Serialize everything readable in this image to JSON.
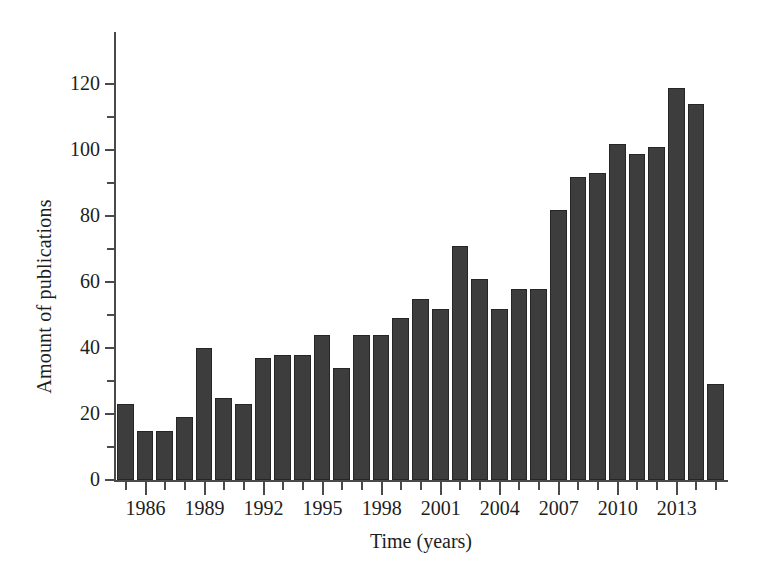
{
  "chart_data": {
    "type": "bar",
    "title": "",
    "subtitle": "",
    "xlabel": "Time (years)",
    "ylabel": "Amount of publications",
    "grid": false,
    "legend": null,
    "ylim": [
      0,
      128
    ],
    "ytick_labels": [
      "0",
      "20",
      "40",
      "60",
      "80",
      "100",
      "120"
    ],
    "ytick_values": [
      0,
      20,
      40,
      60,
      80,
      100,
      120
    ],
    "yminor_tick_values": [
      10,
      30,
      50,
      70,
      90,
      110
    ],
    "xtick_labels": [
      "1986",
      "1989",
      "1992",
      "1995",
      "1998",
      "2001",
      "2004",
      "2007",
      "2010",
      "2013"
    ],
    "xtick_values": [
      1986,
      1989,
      1992,
      1995,
      1998,
      2001,
      2004,
      2007,
      2010,
      2013
    ],
    "xlim": [
      1984.5,
      2015.5
    ],
    "categories": [
      1985,
      1986,
      1987,
      1988,
      1989,
      1990,
      1991,
      1992,
      1993,
      1994,
      1995,
      1996,
      1997,
      1998,
      1999,
      2000,
      2001,
      2002,
      2003,
      2004,
      2005,
      2006,
      2007,
      2008,
      2009,
      2010,
      2011,
      2012,
      2013,
      2014,
      2015
    ],
    "values": [
      23,
      15,
      15,
      19,
      40,
      25,
      23,
      37,
      38,
      38,
      44,
      34,
      44,
      44,
      49,
      55,
      52,
      71,
      61,
      52,
      58,
      58,
      82,
      92,
      93,
      102,
      99,
      101,
      119,
      114,
      29
    ],
    "bar_color": "#3d3d3d",
    "bar_edge_color": "#262626",
    "axis_color": "#4a4a4a",
    "background_color": "#ffffff"
  }
}
